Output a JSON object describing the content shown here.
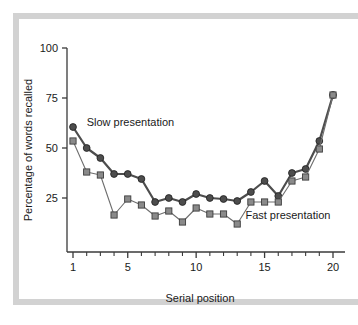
{
  "chart_data": {
    "type": "line",
    "title": "",
    "subtitle": "",
    "xlabel": "Serial position",
    "ylabel": "Percentage of words recalled",
    "xlim": [
      0.4,
      20.6
    ],
    "ylim": [
      0,
      100
    ],
    "xticks": [
      1,
      5,
      10,
      15,
      20
    ],
    "xtick_labels": [
      "1",
      "5",
      "10",
      "15",
      "20"
    ],
    "xtick_minor": [
      2,
      3,
      4,
      6,
      7,
      8,
      9,
      11,
      12,
      13,
      14,
      16,
      17,
      18,
      19
    ],
    "yticks": [
      25,
      50,
      75,
      100
    ],
    "ytick_labels": [
      "25",
      "50",
      "75",
      "100"
    ],
    "grid": false,
    "legend_position": "inline-annotations",
    "x": [
      1,
      2,
      3,
      4,
      5,
      6,
      7,
      8,
      9,
      10,
      11,
      12,
      13,
      14,
      15,
      16,
      17,
      18,
      19,
      20
    ],
    "series": [
      {
        "name": "Slow presentation",
        "marker": "circle",
        "color": "#4d4d4d",
        "line_width": 2.2,
        "values": [
          60.5,
          50.0,
          45.0,
          37.0,
          37.0,
          34.5,
          23.0,
          25.0,
          23.0,
          27.0,
          25.0,
          24.5,
          23.5,
          28.0,
          33.5,
          26.0,
          37.5,
          39.5,
          53.5,
          76.5
        ]
      },
      {
        "name": "Fast presentation",
        "marker": "square",
        "color": "#6e6e6e",
        "line_width": 1.1,
        "values": [
          53.5,
          38.0,
          36.5,
          16.5,
          24.5,
          21.5,
          16.0,
          18.5,
          13.0,
          20.0,
          17.0,
          17.0,
          12.0,
          23.0,
          23.0,
          23.0,
          33.5,
          35.5,
          49.5,
          76.5
        ]
      }
    ],
    "annotations": [
      {
        "text": "Slow presentation",
        "x": 2.0,
        "y": 61.0,
        "anchor": "start"
      },
      {
        "text": "Fast presentation",
        "x": 13.6,
        "y": 14.5,
        "anchor": "start"
      }
    ]
  }
}
